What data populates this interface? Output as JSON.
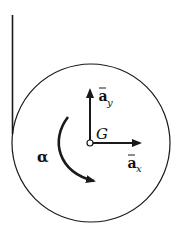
{
  "diagram": {
    "title": "",
    "colors": {
      "stroke": "#1a1a1a",
      "background": "#ffffff"
    },
    "wall": {
      "label": ""
    },
    "disk": {
      "label": ""
    },
    "center_point": {
      "label": "G"
    },
    "vectors": {
      "a_y": {
        "base": "a",
        "subscript": "y",
        "overbar": true
      },
      "a_x": {
        "base": "a",
        "subscript": "x",
        "overbar": true
      }
    },
    "angular_acceleration": {
      "label": "α",
      "direction": "counterclockwise"
    }
  }
}
